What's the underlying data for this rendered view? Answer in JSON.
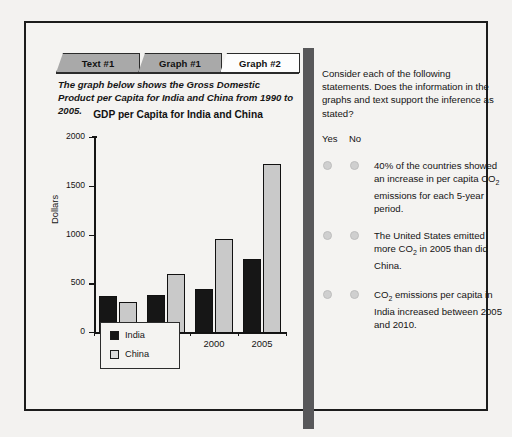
{
  "tabs": [
    {
      "label": "Text #1",
      "active": false
    },
    {
      "label": "Graph #1",
      "active": false
    },
    {
      "label": "Graph #2",
      "active": true
    }
  ],
  "left": {
    "intro": "The graph below shows the Gross Domestic Product per Capita for India and China from 1990 to 2005."
  },
  "right": {
    "prompt": "Consider each of the following statements. Does the information in the graphs and text support the inference as stated?",
    "yes_label": "Yes",
    "no_label": "No",
    "statements": [
      {
        "text_before": "40% of the countries showed an increase in per capita CO",
        "sub": "2",
        "text_after": " emissions for each 5-year period."
      },
      {
        "text_before": "The United States emitted more CO",
        "sub": "2",
        "text_after": " in 2005 than did China."
      },
      {
        "text_before": "CO",
        "sub": "2",
        "text_after": " emissions per capita in India increased between 2005 and 2010."
      }
    ]
  },
  "chart_data": {
    "type": "bar",
    "title": "GDP per Capita for India and China",
    "xlabel": "",
    "ylabel": "Dollars",
    "categories": [
      "1990",
      "1995",
      "2000",
      "2005"
    ],
    "series": [
      {
        "name": "India",
        "color": "#161616",
        "values": [
          375,
          385,
          450,
          760
        ]
      },
      {
        "name": "China",
        "color": "#c9c9c9",
        "values": [
          320,
          605,
          960,
          1730
        ]
      }
    ],
    "ylim": [
      0,
      2000
    ],
    "yticks": [
      0,
      500,
      1000,
      1500,
      2000
    ],
    "grid": false,
    "legend_position": "bottom-left"
  },
  "colors": {
    "separator": "#58585a",
    "frame": "#1c1c1c",
    "tab_inactive": "#a9a9a9",
    "tab_active": "#fdfdfd",
    "radio": "#cfcfcf"
  }
}
